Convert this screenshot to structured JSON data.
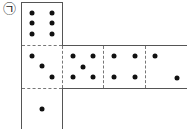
{
  "diagram": {
    "label": "㉠",
    "faces": [
      {
        "name": "top",
        "pips": 6
      },
      {
        "name": "center",
        "pips": 3
      },
      {
        "name": "right-1",
        "pips": 5
      },
      {
        "name": "right-2",
        "pips": 4
      },
      {
        "name": "right-3",
        "pips": 2
      },
      {
        "name": "bottom",
        "pips": 1
      }
    ]
  }
}
